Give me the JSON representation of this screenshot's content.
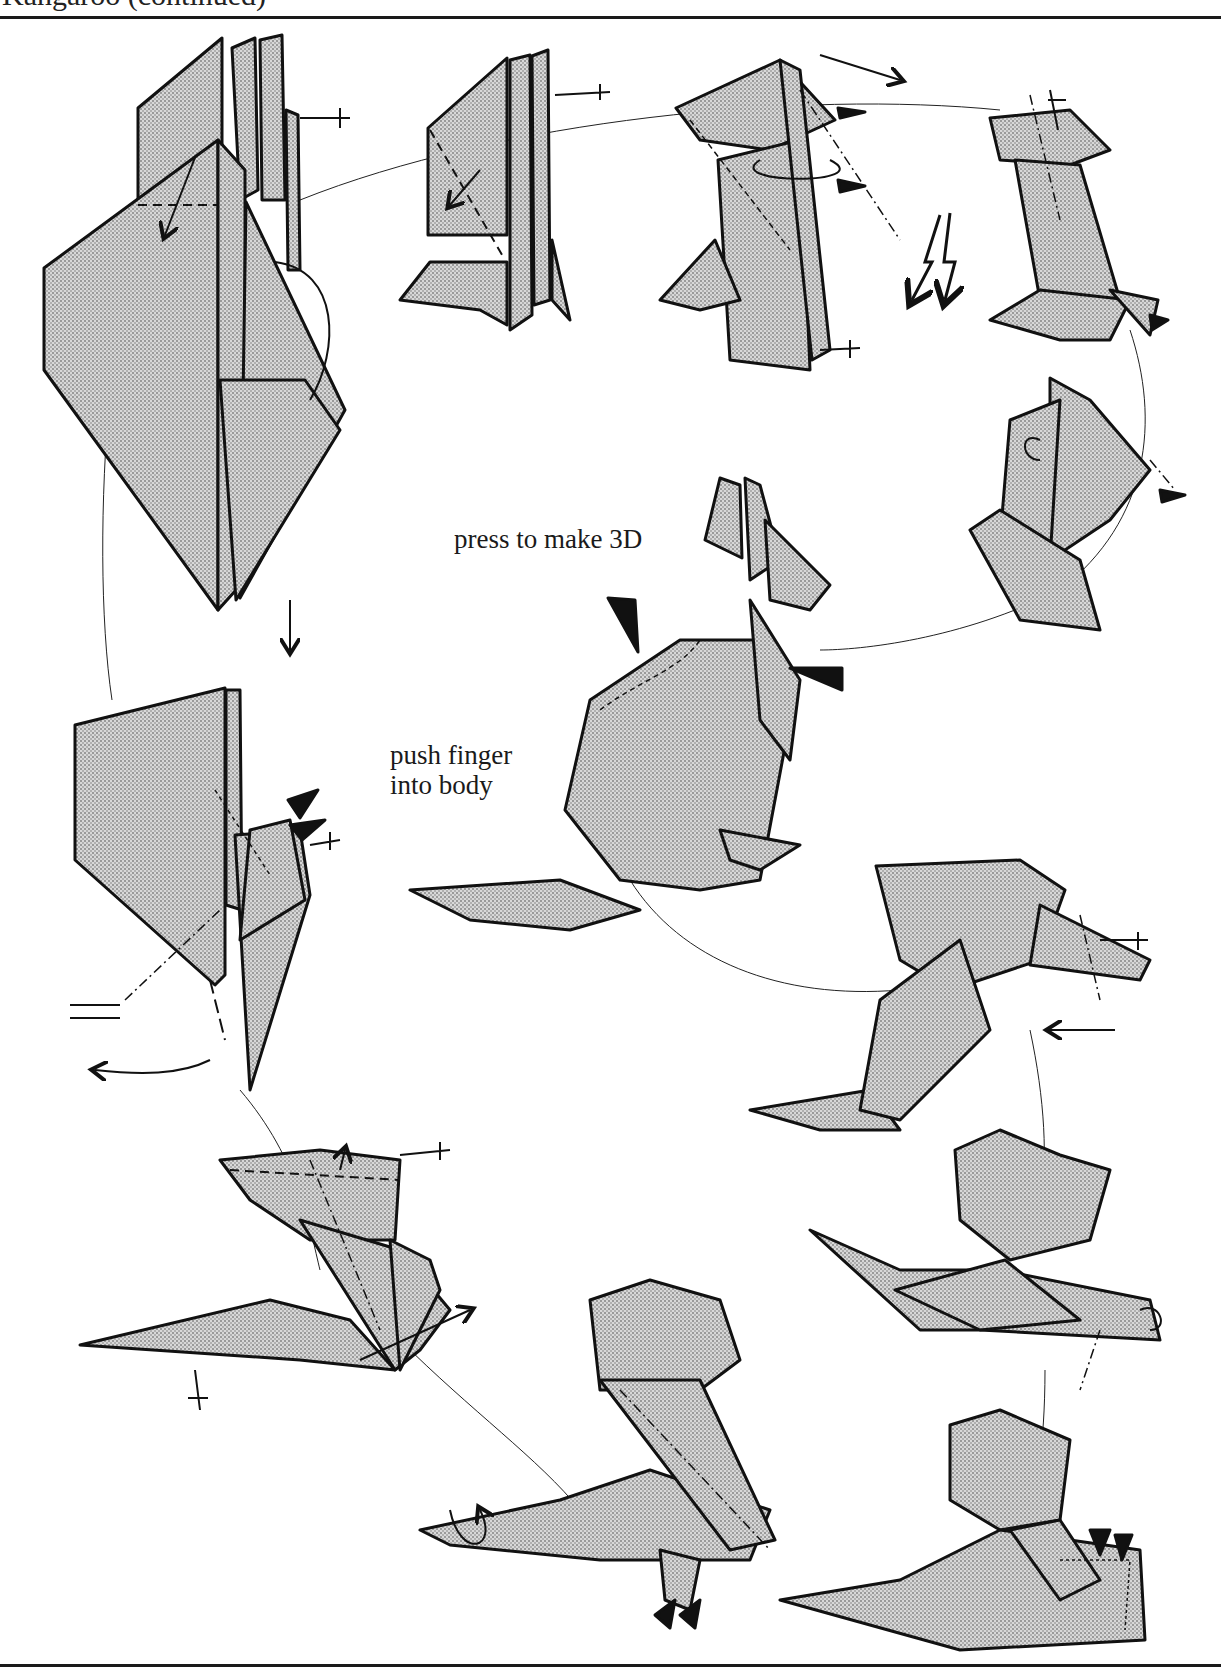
{
  "page": {
    "header_title": "Kangaroo (continued)"
  },
  "annotations": {
    "press_to_make_3d": "press to make 3D",
    "push_finger_line1": "push finger",
    "push_finger_line2": "into body"
  },
  "steps": [
    {
      "id": "step-a",
      "description": "stacked flaps, valley fold flap down, swivel"
    },
    {
      "id": "step-b",
      "description": "valley fold diagonal"
    },
    {
      "id": "step-c",
      "description": "inside reverse folds on head"
    },
    {
      "id": "step-d",
      "description": "sink and reverse fold legs"
    },
    {
      "id": "step-e",
      "description": "shape head and ears"
    },
    {
      "id": "step-f",
      "description": "finished kangaroo, press to make 3D"
    },
    {
      "id": "step-g",
      "description": "reverse fold tail"
    },
    {
      "id": "step-h",
      "description": "valley folds on body"
    },
    {
      "id": "step-i",
      "description": "reverse folds on tail"
    },
    {
      "id": "step-j",
      "description": "crimp legs"
    },
    {
      "id": "step-k",
      "description": "rabbit ear foot"
    },
    {
      "id": "step-l",
      "description": "push in legs"
    }
  ],
  "colors": {
    "paper_shade": "#c4c4c4",
    "ink": "#111111",
    "background": "#ffffff"
  }
}
